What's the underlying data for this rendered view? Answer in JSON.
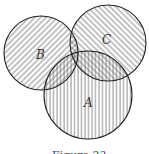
{
  "diagram": {
    "type": "venn",
    "sets": [
      {
        "id": "A",
        "label": "A",
        "cx": 88,
        "cy": 95,
        "r": 44,
        "hatch": "vertical",
        "label_x": 88,
        "label_y": 107
      },
      {
        "id": "B",
        "label": "B",
        "cx": 41,
        "cy": 53,
        "r": 37,
        "hatch": "diagonal-right",
        "label_x": 40,
        "label_y": 59
      },
      {
        "id": "C",
        "label": "C",
        "cx": 108,
        "cy": 43,
        "r": 38,
        "hatch": "diagonal-left",
        "label_x": 106,
        "label_y": 44
      }
    ],
    "caption": "Figure 23",
    "stroke_color": "#222222",
    "hatch_color": "#555555",
    "background": "#ffffff"
  }
}
